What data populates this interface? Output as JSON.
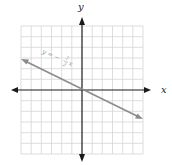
{
  "graph": {
    "x_axis_label": "x",
    "y_axis_label": "y",
    "x_range": [
      -6,
      6
    ],
    "y_range": [
      -6,
      6
    ],
    "grid": true,
    "colors": {
      "grid": "#d0d0d0",
      "axis": "#1a1a1a",
      "line": "#8c8c8c",
      "equation": "#9a9a9a"
    }
  },
  "line": {
    "equation_lhs": "y = −",
    "fraction_num": "1",
    "fraction_den": "2",
    "equation_var": "x",
    "slope": -0.5,
    "intercept": 0
  }
}
